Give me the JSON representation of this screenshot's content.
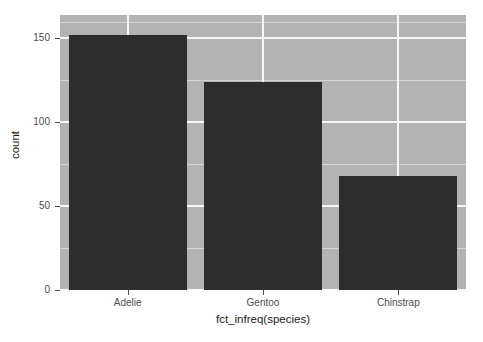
{
  "chart_data": {
    "type": "bar",
    "title": "",
    "subtitle": "",
    "xlabel": "fct_infreq(species)",
    "ylabel": "count",
    "categories": [
      "Adelie",
      "Gentoo",
      "Chinstrap"
    ],
    "values": [
      152,
      124,
      68
    ],
    "series": [
      {
        "name": "count",
        "values": [
          152,
          124,
          68
        ]
      }
    ],
    "ylim": [
      0,
      164
    ],
    "yticks": [
      0,
      50,
      100,
      150
    ],
    "ytick_labels": [
      "0",
      "50",
      "100",
      "150"
    ],
    "yminor_ticks": [
      25,
      75,
      125,
      160
    ],
    "xtick_labels": [
      "Adelie",
      "Gentoo",
      "Chinstrap"
    ],
    "grid": true,
    "grid_major_color": "#f7f7f7",
    "grid_minor_color": "#d4d4d4",
    "legend": null,
    "legend_position": "none",
    "bar_color": "#2d2d2d",
    "panel_background": "#b3b3b3",
    "plot_background": "#ffffff",
    "axis_text_color": "#4d4d4d",
    "axis_title_color": "#1a1a1a"
  },
  "axes": {
    "y": {
      "title": "count",
      "ticks": [
        {
          "label": "150",
          "value": 150
        },
        {
          "label": "100",
          "value": 100
        },
        {
          "label": "50",
          "value": 50
        },
        {
          "label": "0",
          "value": 0
        }
      ]
    },
    "x": {
      "title": "fct_infreq(species)",
      "ticks": [
        {
          "label": "Adelie"
        },
        {
          "label": "Gentoo"
        },
        {
          "label": "Chinstrap"
        }
      ]
    }
  },
  "bars": [
    {
      "category": "Adelie",
      "count": 152
    },
    {
      "category": "Gentoo",
      "count": 124
    },
    {
      "category": "Chinstrap",
      "count": 68
    }
  ]
}
